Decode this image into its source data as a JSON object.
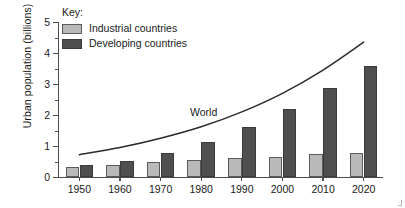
{
  "chart_data": {
    "type": "bar",
    "title": "",
    "xlabel": "",
    "ylabel": "Urban population (billions)",
    "ylim": [
      0,
      5
    ],
    "ytick_labels": [
      "0",
      "1",
      "2",
      "3",
      "4",
      "5"
    ],
    "ytick_values": [
      0,
      1,
      2,
      3,
      4,
      5
    ],
    "yminor_values": [
      0.5,
      1.5,
      2.5,
      3.5,
      4.5
    ],
    "grid": false,
    "legend_position": "top-left",
    "legend_title": "Key:",
    "categories": [
      "1950",
      "1960",
      "1970",
      "1980",
      "1990",
      "2000",
      "2010",
      "2020"
    ],
    "series": [
      {
        "name": "Industrial countries",
        "color": "#b9b9b9",
        "values": [
          0.32,
          0.4,
          0.48,
          0.55,
          0.6,
          0.65,
          0.73,
          0.78
        ]
      },
      {
        "name": "Developing countries",
        "color": "#4f4f4f",
        "values": [
          0.38,
          0.52,
          0.76,
          1.12,
          1.62,
          2.2,
          2.87,
          3.57
        ]
      }
    ],
    "overlay_line": {
      "name": "World",
      "color": "#2b2b2b",
      "x": [
        "1950",
        "1960",
        "1970",
        "1980",
        "1990",
        "2000",
        "2010",
        "2020"
      ],
      "values": [
        0.72,
        0.95,
        1.25,
        1.62,
        2.1,
        2.7,
        3.45,
        4.35
      ]
    },
    "annotations": [
      {
        "text": "World",
        "x": "1985",
        "y": 2.05
      }
    ]
  },
  "legend": {
    "title": "Key:",
    "items": [
      {
        "label": "Industrial countries",
        "color": "#b9b9b9"
      },
      {
        "label": "Developing countries",
        "color": "#4f4f4f"
      }
    ]
  },
  "axes": {
    "y_title": "Urban population (billions)"
  }
}
